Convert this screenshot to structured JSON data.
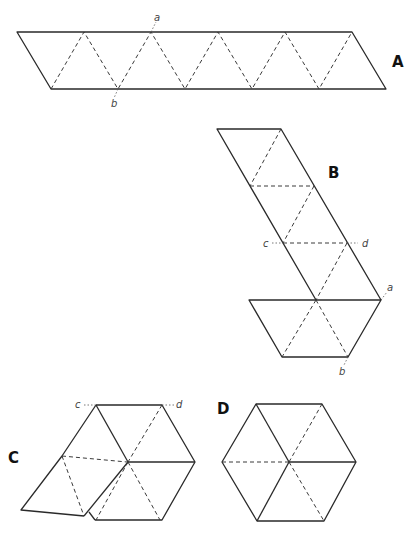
{
  "figures": {
    "A": {
      "label": "A",
      "points": {
        "a": "a",
        "b": "b"
      }
    },
    "B": {
      "label": "B",
      "points": {
        "a": "a",
        "b": "b",
        "c": "c",
        "d": "d"
      }
    },
    "C": {
      "label": "C",
      "points": {
        "c": "c",
        "d": "d"
      }
    },
    "D": {
      "label": "D"
    }
  }
}
